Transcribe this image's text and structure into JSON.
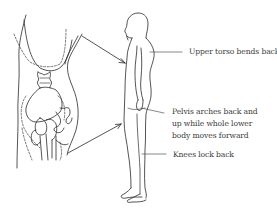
{
  "diagram": {
    "type": "anatomical-line-drawing",
    "left_panel": "pelvis-skeleton-closeup",
    "right_panel": "standing-figure-side-view",
    "stroke_color": "#2a2a2a",
    "dashed_outline_color": "#555555",
    "annotations": [
      {
        "id": "upper-torso",
        "lines": [
          "Upper torso bends back"
        ]
      },
      {
        "id": "pelvis",
        "lines": [
          "Pelvis arches back and",
          "up while whole lower",
          "body moves forward"
        ]
      },
      {
        "id": "knees",
        "lines": [
          "Knees lock back"
        ]
      }
    ]
  }
}
